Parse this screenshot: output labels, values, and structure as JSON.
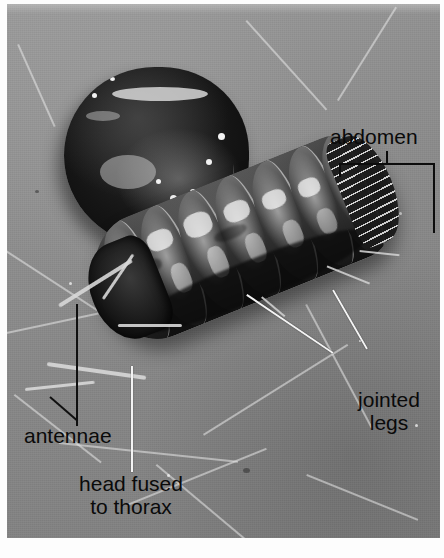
{
  "figure": {
    "kind": "labeled-photograph",
    "color_mode": "grayscale",
    "colors": {
      "plate_background": "#8b8b8b",
      "page_background": "#ffffff",
      "label_text": "#0a0a0a",
      "white_leader": "#f4f4f4",
      "black_leader": "#101010",
      "bug_dark": "#101010",
      "bug_highlight": "#f2f2f2"
    }
  },
  "labels": {
    "abdomen": {
      "text": "abdomen",
      "leader_style": "bracket"
    },
    "jointed_legs": {
      "line1": "jointed",
      "line2": "legs",
      "leader_style": "two-white-lines"
    },
    "antennae": {
      "text": "antennae",
      "leader_style": "two-black-lines"
    },
    "head_fused_to_thorax": {
      "line1": "head fused",
      "line2": "to thorax",
      "leader_style": "single-white-line"
    }
  },
  "caption": {
    "text": ""
  }
}
